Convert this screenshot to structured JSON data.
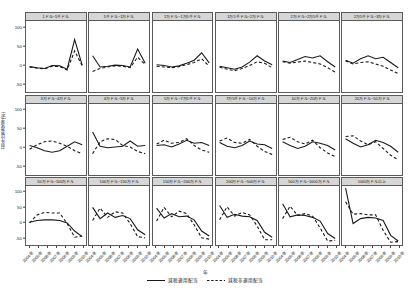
{
  "chart_data": {
    "type": "line",
    "title": "",
    "xlabel": "年",
    "ylabel": "前年比変化率(%)",
    "ylim": [
      -75,
      115
    ],
    "yticks": [
      100,
      50,
      0,
      -50
    ],
    "ytick_labels": [
      "100",
      "50",
      "0",
      "-50"
    ],
    "grid": false,
    "legend_position": "bottom",
    "x": [
      "2004年",
      "2005年",
      "2006年",
      "2007年",
      "2008年",
      "2009年",
      "2010年"
    ],
    "xtick_labels": [
      "2004年",
      "2005年",
      "2006年",
      "2007年",
      "2008年",
      "2009年",
      "2010年"
    ],
    "series_names": [
      "減税適用配当",
      "減税非適用配当"
    ],
    "series_styles": [
      "solid",
      "dashed"
    ],
    "series_colors": [
      "#1a1a1a",
      "#1a1a1a"
    ],
    "panels": [
      {
        "title": "1ドル~5千ドル",
        "series": [
          {
            "name": "減税適用配当",
            "values": [
              -7,
              -10,
              -12,
              -4,
              -5,
              -14,
              65,
              -3
            ]
          },
          {
            "name": "減税非適用配当",
            "values": [
              -8,
              -11,
              -13,
              -6,
              -7,
              -16,
              35,
              -5
            ]
          }
        ]
      },
      {
        "title": "5千ドル~1万ドル",
        "series": [
          {
            "name": "減税適用配当",
            "values": [
              22,
              -8,
              -6,
              -3,
              -4,
              -8,
              40,
              2
            ]
          },
          {
            "name": "減税非適用配当",
            "values": [
              -20,
              -12,
              -8,
              -5,
              -6,
              -10,
              18,
              -2
            ]
          }
        ]
      },
      {
        "title": "1万ドル~1万5千ドル",
        "series": [
          {
            "name": "減税適用配当",
            "values": [
              -2,
              -4,
              -8,
              -5,
              2,
              10,
              30,
              3
            ]
          },
          {
            "name": "減税非適用配当",
            "values": [
              -6,
              -8,
              -10,
              -7,
              -2,
              4,
              14,
              -6
            ]
          }
        ]
      },
      {
        "title": "1万5千ドル~2万ドル",
        "series": [
          {
            "name": "減税適用配当",
            "values": [
              -6,
              -10,
              -14,
              -8,
              5,
              22,
              8,
              -2
            ]
          },
          {
            "name": "減税非適用配当",
            "values": [
              -9,
              -14,
              -18,
              -12,
              -4,
              6,
              2,
              -10
            ]
          }
        ]
      },
      {
        "title": "2万ドル~2万5千ドル",
        "series": [
          {
            "name": "減税適用配当",
            "values": [
              8,
              4,
              12,
              20,
              16,
              22,
              6,
              -8
            ]
          },
          {
            "name": "減税非適用配当",
            "values": [
              6,
              2,
              5,
              8,
              4,
              0,
              -10,
              -22
            ]
          }
        ]
      },
      {
        "title": "2万5千ドル~3万ドル",
        "series": [
          {
            "name": "減税適用配当",
            "values": [
              10,
              2,
              14,
              22,
              14,
              18,
              4,
              -10
            ]
          },
          {
            "name": "減税非適用配当",
            "values": [
              8,
              0,
              4,
              6,
              0,
              -6,
              -16,
              -26
            ]
          }
        ]
      },
      {
        "title": "3万ドル~4万ドル",
        "series": [
          {
            "name": "減税適用配当",
            "values": [
              4,
              -2,
              -10,
              -14,
              -10,
              2,
              14,
              6
            ]
          },
          {
            "name": "減税非適用配当",
            "values": [
              -6,
              6,
              14,
              16,
              10,
              2,
              -10,
              -18
            ]
          }
        ]
      },
      {
        "title": "4万ドル~5万ドル",
        "series": [
          {
            "name": "減税適用配当",
            "values": [
              40,
              2,
              -2,
              0,
              2,
              16,
              2,
              4
            ]
          },
          {
            "name": "減税非適用配当",
            "values": [
              -18,
              14,
              22,
              20,
              4,
              0,
              -12,
              -18
            ]
          }
        ]
      },
      {
        "title": "5万ドル~7万5千ドル",
        "series": [
          {
            "name": "減税適用配当",
            "values": [
              4,
              6,
              0,
              8,
              18,
              10,
              12,
              4
            ]
          },
          {
            "name": "減税非適用配当",
            "values": [
              8,
              18,
              10,
              12,
              22,
              4,
              -8,
              -14
            ]
          }
        ]
      },
      {
        "title": "7万5千ドル~10万ドル",
        "series": [
          {
            "name": "減税適用配当",
            "values": [
              12,
              2,
              -2,
              4,
              16,
              8,
              6,
              -4
            ]
          },
          {
            "name": "減税非適用配当",
            "values": [
              16,
              24,
              12,
              10,
              20,
              2,
              -12,
              -20
            ]
          }
        ]
      },
      {
        "title": "10万ドル~20万ドル",
        "series": [
          {
            "name": "減税適用配当",
            "values": [
              14,
              4,
              -4,
              2,
              14,
              10,
              4,
              -8
            ]
          },
          {
            "name": "減税非適用配当",
            "values": [
              20,
              26,
              14,
              8,
              18,
              -2,
              -16,
              -26
            ]
          }
        ]
      },
      {
        "title": "20万ドル~50万ドル",
        "series": [
          {
            "name": "減税適用配当",
            "values": [
              22,
              10,
              0,
              6,
              18,
              12,
              2,
              -14
            ]
          },
          {
            "name": "減税非適用配当",
            "values": [
              28,
              30,
              16,
              6,
              14,
              -4,
              -22,
              -34
            ]
          }
        ]
      },
      {
        "title": "50万ドル~100万ドル",
        "series": [
          {
            "name": "減税適用配当",
            "values": [
              -2,
              4,
              6,
              6,
              4,
              -4,
              -30,
              -48
            ]
          },
          {
            "name": "減税非適用配当",
            "values": [
              -4,
              22,
              30,
              28,
              28,
              -6,
              -50,
              -46
            ]
          }
        ]
      },
      {
        "title": "100万ドル~150万ドル",
        "series": [
          {
            "name": "減税適用配当",
            "values": [
              46,
              10,
              28,
              14,
              20,
              10,
              -26,
              -42
            ]
          },
          {
            "name": "減税非適用配当",
            "values": [
              4,
              44,
              14,
              32,
              28,
              -6,
              -48,
              -52
            ]
          }
        ]
      },
      {
        "title": "150万ドル~200万ドル",
        "series": [
          {
            "name": "減税適用配当",
            "values": [
              44,
              12,
              26,
              16,
              18,
              6,
              -30,
              -46
            ]
          },
          {
            "name": "減税非適用配当",
            "values": [
              2,
              46,
              16,
              34,
              26,
              -10,
              -52,
              -56
            ]
          }
        ]
      },
      {
        "title": "200万ドル~500万ドル",
        "series": [
          {
            "name": "減税適用配当",
            "values": [
              52,
              14,
              24,
              18,
              16,
              4,
              -34,
              -50
            ]
          },
          {
            "name": "減税非適用配当",
            "values": [
              6,
              48,
              18,
              30,
              22,
              -14,
              -58,
              -58
            ]
          }
        ]
      },
      {
        "title": "500万ドル~1000万ドル",
        "series": [
          {
            "name": "減税適用配当",
            "values": [
              58,
              16,
              22,
              20,
              14,
              2,
              -38,
              -54
            ]
          },
          {
            "name": "減税非適用配当",
            "values": [
              10,
              50,
              20,
              26,
              18,
              -20,
              -62,
              -60
            ]
          }
        ]
      },
      {
        "title": "1000万ドル以上",
        "series": [
          {
            "name": "減税適用配当",
            "values": [
              108,
              -6,
              10,
              14,
              12,
              4,
              -44,
              -62
            ]
          },
          {
            "name": "減税非適用配当",
            "values": [
              64,
              24,
              26,
              22,
              22,
              -28,
              -66,
              -64
            ]
          }
        ]
      }
    ]
  },
  "legend": {
    "items": [
      {
        "label": "減税適用配当",
        "style": "solid"
      },
      {
        "label": "減税非適用配当",
        "style": "dashed"
      }
    ]
  }
}
